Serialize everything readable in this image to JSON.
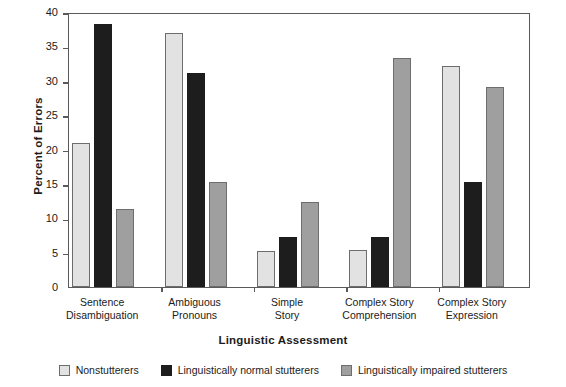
{
  "chart_data": {
    "type": "bar",
    "title": "",
    "xlabel": "Linguistic Assessment",
    "ylabel": "Percent of Errors",
    "ylim": [
      0,
      40
    ],
    "ytick_step": 5,
    "yticks": [
      0,
      5,
      10,
      15,
      20,
      25,
      30,
      35,
      40
    ],
    "ytick_labels": [
      "0",
      "5",
      "10",
      "15",
      "20",
      "25",
      "30",
      "35",
      "40"
    ],
    "grid": false,
    "legend_position": "bottom-center",
    "categories": [
      "Sentence Disambiguation",
      "Ambiguous Pronouns",
      "Simple Story",
      "Complex Story Comprehension",
      "Complex Story Expression"
    ],
    "category_lines": [
      [
        "Sentence",
        "Disambiguation"
      ],
      [
        "Ambiguous",
        "Pronouns"
      ],
      [
        "Simple",
        "Story"
      ],
      [
        "Complex Story",
        "Comprehension"
      ],
      [
        "Complex Story",
        "Expression"
      ]
    ],
    "series": [
      {
        "name": "Nonstutterers",
        "color": "#e2e2e2",
        "values": [
          21.0,
          37.0,
          5.3,
          5.4,
          32.1
        ]
      },
      {
        "name": "Linguistically normal stutterers",
        "color": "#1d1d1d",
        "values": [
          38.3,
          31.2,
          7.3,
          7.3,
          15.3
        ]
      },
      {
        "name": "Linguistically impaired stutterers",
        "color": "#9f9f9f",
        "values": [
          11.4,
          15.3,
          12.3,
          33.3,
          29.1
        ]
      }
    ]
  },
  "colors": {
    "axis": "#5a5a5a",
    "text": "#1b1b1b",
    "background": "#ffffff",
    "series_nonstutterers": "#e2e2e2",
    "series_normal_stutterers": "#1d1d1d",
    "series_impaired_stutterers": "#9f9f9f"
  }
}
